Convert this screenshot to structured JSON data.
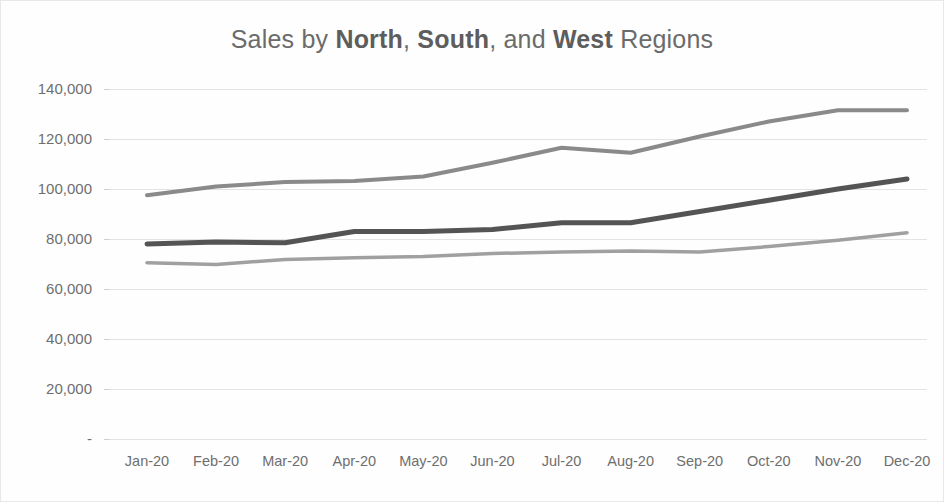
{
  "chart_data": {
    "type": "line",
    "title": "Sales by North, South, and West Regions",
    "title_parts": [
      {
        "text": "Sales by ",
        "bold": false
      },
      {
        "text": "North",
        "bold": true
      },
      {
        "text": ", ",
        "bold": false
      },
      {
        "text": "South",
        "bold": true
      },
      {
        "text": ", and ",
        "bold": false
      },
      {
        "text": "West",
        "bold": true
      },
      {
        "text": " Regions",
        "bold": false
      }
    ],
    "categories": [
      "Jan-20",
      "Feb-20",
      "Mar-20",
      "Apr-20",
      "May-20",
      "Jun-20",
      "Jul-20",
      "Aug-20",
      "Sep-20",
      "Oct-20",
      "Nov-20",
      "Dec-20"
    ],
    "series": [
      {
        "name": "North",
        "color": "#8a8a8a",
        "width": 4,
        "values": [
          97500,
          101000,
          102800,
          103200,
          105000,
          110500,
          116500,
          114500,
          121000,
          127000,
          131500,
          131500
        ]
      },
      {
        "name": "South",
        "color": "#545454",
        "width": 5,
        "values": [
          78000,
          78800,
          78500,
          83000,
          83000,
          83800,
          86500,
          86500,
          91000,
          95500,
          100000,
          104000
        ]
      },
      {
        "name": "West",
        "color": "#a0a0a0",
        "width": 3.5,
        "values": [
          70500,
          69800,
          71800,
          72500,
          73000,
          74200,
          74800,
          75200,
          74800,
          77000,
          79500,
          82500
        ]
      }
    ],
    "ylabel": "",
    "xlabel": "",
    "ylim": [
      0,
      140000
    ],
    "ytick_values": [
      140000,
      120000,
      100000,
      80000,
      60000,
      40000,
      20000,
      0
    ],
    "ytick_labels": [
      "140,000",
      "120,000",
      "100,000",
      "80,000",
      "60,000",
      "40,000",
      "20,000",
      "-"
    ],
    "grid": true,
    "grid_color": "#e3e3e3",
    "legend": "none",
    "background": "#ffffff",
    "axis_text_color": "#6e6e6e",
    "title_color": "#6b6b6b"
  }
}
